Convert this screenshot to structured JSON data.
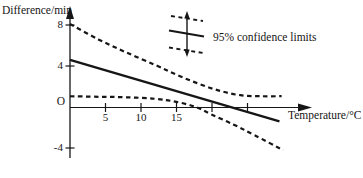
{
  "chart_data": {
    "type": "line",
    "title": "",
    "xlabel": "Temperature/°C",
    "ylabel": "Difference/min",
    "origin_label": "O",
    "xlim": [
      0,
      33
    ],
    "ylim": [
      -5,
      9.5
    ],
    "grid": false,
    "x_ticks": [
      {
        "value": 5,
        "label": "5"
      },
      {
        "value": 10,
        "label": "10"
      },
      {
        "value": 15,
        "label": "15"
      },
      {
        "value": 20,
        "label": ""
      },
      {
        "value": 25,
        "label": ""
      }
    ],
    "y_ticks": [
      {
        "value": 8,
        "label": "8"
      },
      {
        "value": 4,
        "label": "4"
      },
      {
        "value": -4,
        "label": "-4"
      }
    ],
    "legend": [
      {
        "label": "95% confidence limits",
        "symbol": "error-bar-with-band"
      }
    ],
    "series": [
      {
        "name": "fitted-line",
        "style": "solid",
        "points": [
          [
            0,
            4.6
          ],
          [
            29.5,
            -1.4
          ]
        ]
      },
      {
        "name": "upper-95-confidence-limit",
        "style": "dashed",
        "points": [
          [
            0,
            8.1
          ],
          [
            4,
            6.6
          ],
          [
            8,
            5.3
          ],
          [
            12,
            4.1
          ],
          [
            15,
            3.15
          ],
          [
            18,
            2.3
          ],
          [
            21,
            1.6
          ],
          [
            24,
            1.15
          ],
          [
            27,
            1.05
          ],
          [
            29.8,
            1.05
          ]
        ]
      },
      {
        "name": "lower-95-confidence-limit",
        "style": "dashed",
        "points": [
          [
            0,
            1.05
          ],
          [
            4,
            1.0
          ],
          [
            8,
            0.95
          ],
          [
            12,
            0.8
          ],
          [
            15,
            0.5
          ],
          [
            17.7,
            0
          ],
          [
            20,
            -0.75
          ],
          [
            23,
            -1.7
          ],
          [
            26,
            -2.75
          ],
          [
            30,
            -4.2
          ]
        ]
      }
    ]
  }
}
